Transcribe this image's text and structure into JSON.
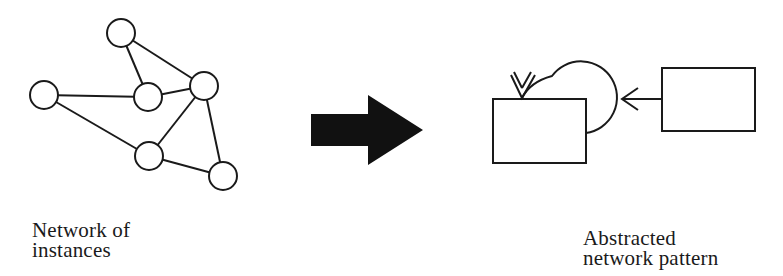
{
  "left_panel": {
    "caption": [
      "Network of",
      "instances"
    ],
    "nodes": [
      {
        "id": "top",
        "cx": 121,
        "cy": 33
      },
      {
        "id": "left",
        "cx": 44,
        "cy": 95
      },
      {
        "id": "center",
        "cx": 148,
        "cy": 97
      },
      {
        "id": "right",
        "cx": 204,
        "cy": 86
      },
      {
        "id": "lower",
        "cx": 149,
        "cy": 156
      },
      {
        "id": "bottom-right",
        "cx": 223,
        "cy": 176
      }
    ],
    "edges": [
      [
        "top",
        "right"
      ],
      [
        "top",
        "center"
      ],
      [
        "left",
        "center"
      ],
      [
        "left",
        "lower"
      ],
      [
        "center",
        "right"
      ],
      [
        "right",
        "lower"
      ],
      [
        "right",
        "bottom-right"
      ],
      [
        "lower",
        "bottom-right"
      ]
    ],
    "node_radius": 14
  },
  "transition_arrow": {
    "icon": "right-arrow-icon",
    "color": "#111111"
  },
  "right_panel": {
    "caption": [
      "Abstracted",
      "network pattern"
    ],
    "boxes": [
      {
        "id": "self-loop-box",
        "x": 493,
        "y": 99,
        "w": 93,
        "h": 64
      },
      {
        "id": "source-box",
        "x": 662,
        "y": 68,
        "w": 93,
        "h": 63
      }
    ]
  },
  "colors": {
    "stroke": "#1a1a1a",
    "background": "#ffffff"
  }
}
